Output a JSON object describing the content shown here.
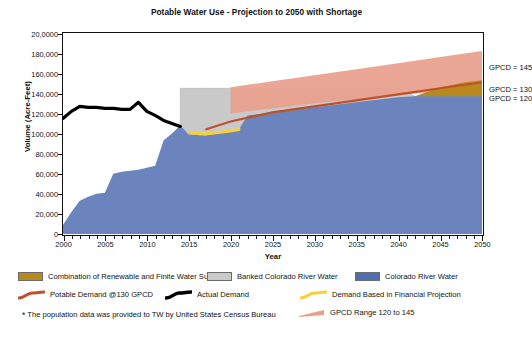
{
  "chart_data": {
    "type": "area",
    "title": "Potable Water Use - Projection to 2050 with Shortage",
    "xlabel": "Year",
    "ylabel": "Volume (Acre-Feet)",
    "xlim": [
      2000,
      2050
    ],
    "ylim": [
      0,
      200000
    ],
    "grid": false,
    "legend_position": "bottom",
    "x_ticks": [
      "2000",
      "2005",
      "2010",
      "2015",
      "2020",
      "2025",
      "2030",
      "2035",
      "2040",
      "2045",
      "2050"
    ],
    "y_ticks": [
      "20,0000",
      "180,000",
      "160,000",
      "140,000",
      "120,000",
      "100,000",
      "80,000",
      "60,000",
      "40,000",
      "20,000",
      "0"
    ],
    "y_tick_values": [
      200000,
      180000,
      160000,
      140000,
      120000,
      100000,
      80000,
      60000,
      40000,
      20000,
      0
    ],
    "annotations": [
      {
        "text": "GPCD = 145",
        "x": 2050,
        "y": 167000
      },
      {
        "text": "GPCD = 130",
        "x": 2050,
        "y": 145000
      },
      {
        "text": "GPCD = 120",
        "x": 2050,
        "y": 136000
      }
    ],
    "series": [
      {
        "name": "Colorado River Water",
        "type": "area",
        "color": "#6b84bd",
        "x": [
          2000,
          2001,
          2002,
          2003,
          2004,
          2005,
          2006,
          2007,
          2008,
          2009,
          2010,
          2011,
          2012,
          2013,
          2014,
          2015,
          2016,
          2017,
          2018,
          2019,
          2020,
          2021,
          2022,
          2023,
          2025,
          2030,
          2035,
          2040,
          2042,
          2045,
          2050
        ],
        "values": [
          9000,
          22000,
          33000,
          37000,
          40000,
          41000,
          60000,
          62000,
          63000,
          64000,
          66000,
          68000,
          93000,
          100000,
          108000,
          99000,
          98500,
          98000,
          100000,
          101000,
          102000,
          104000,
          118000,
          119000,
          121000,
          126000,
          131000,
          136000,
          137000,
          137000,
          137000
        ]
      },
      {
        "name": "Banked Colorado River Water",
        "type": "area",
        "color": "#c9c9c9",
        "x": [
          2014,
          2015,
          2016,
          2017,
          2018,
          2019,
          2020,
          2021,
          2022,
          2025,
          2030,
          2035,
          2040,
          2042
        ],
        "values": [
          145000,
          145000,
          145000,
          145000,
          145000,
          145000,
          145000,
          145000,
          145000,
          145000,
          145000,
          145000,
          145000,
          137000
        ]
      },
      {
        "name": "Combination of Renewable and Finite Water Supplies",
        "type": "area",
        "color": "#b8891f",
        "x": [
          2042,
          2045,
          2048,
          2050
        ],
        "values": [
          137000,
          146000,
          151000,
          153000
        ]
      },
      {
        "name": "GPCD Range 120 to 145",
        "type": "band",
        "color": "#e8a08c",
        "x": [
          2020,
          2025,
          2030,
          2035,
          2040,
          2045,
          2050
        ],
        "upper": [
          146000,
          152000,
          158000,
          164000,
          170000,
          176000,
          182000
        ],
        "lower": [
          120000,
          125000,
          130000,
          134000,
          138000,
          142000,
          146000
        ]
      },
      {
        "name": "Potable Demand @130 GPCD",
        "type": "line",
        "color": "#c0502a",
        "x": [
          2017,
          2020,
          2025,
          2030,
          2035,
          2040,
          2045,
          2050
        ],
        "values": [
          104000,
          112000,
          121000,
          127000,
          133000,
          139000,
          145000,
          151000
        ]
      },
      {
        "name": "Actual Demand",
        "type": "line",
        "color": "#000000",
        "x": [
          2000,
          2001,
          2002,
          2003,
          2004,
          2005,
          2006,
          2007,
          2008,
          2009,
          2010,
          2011,
          2012,
          2013,
          2014
        ],
        "values": [
          115000,
          122000,
          127000,
          126000,
          126000,
          125000,
          125000,
          124000,
          124000,
          131000,
          122000,
          118000,
          113000,
          110000,
          107000
        ]
      },
      {
        "name": "Demand Based in Financial Projection",
        "type": "line",
        "color": "#f5d23c",
        "x": [
          2015,
          2016,
          2017,
          2018,
          2019,
          2020,
          2021
        ],
        "values": [
          101000,
          100000,
          99500,
          100500,
          101500,
          102500,
          104000
        ]
      }
    ]
  },
  "legend": {
    "rows": [
      [
        {
          "label": "Combination of Renewable and Finite Water Supplies",
          "color": "#b8891f",
          "style": "box",
          "name": "combination-renewable-finite"
        },
        {
          "label": "Banked Colorado River Water",
          "color": "#c9c9c9",
          "style": "box",
          "name": "banked-colorado-river-water"
        },
        {
          "label": "Colorado River Water",
          "color": "#4f6fb5",
          "style": "box",
          "name": "colorado-river-water"
        }
      ],
      [
        {
          "label": "Potable Demand @130 GPCD",
          "color": "#c0502a",
          "style": "line",
          "name": "potable-demand-130-gpcd"
        },
        {
          "label": "Actual Demand",
          "color": "#000000",
          "style": "line",
          "name": "actual-demand"
        },
        {
          "label": "Demand Based in Financial Projection",
          "color": "#f5d23c",
          "style": "line",
          "name": "demand-financial-projection"
        }
      ],
      [
        {
          "label": "GPCD Range 120 to 145",
          "color": "#e8a08c",
          "style": "wedge",
          "name": "gpcd-range-120-145"
        }
      ]
    ],
    "footnote": "The population data was provided to TW by United States Census Bureau",
    "footnote_marker": "*"
  }
}
